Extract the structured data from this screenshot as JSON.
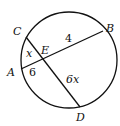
{
  "diagram": {
    "type": "intersecting-chords",
    "points": {
      "A": "A",
      "B": "B",
      "C": "C",
      "D": "D",
      "E": "E"
    },
    "chords": [
      {
        "name": "AB",
        "from": "A",
        "to": "B",
        "through": "E"
      },
      {
        "name": "CD",
        "from": "C",
        "to": "D",
        "through": "E"
      }
    ],
    "segment_labels": {
      "CE": "x",
      "EB": "4",
      "AE": "6",
      "ED": "6x"
    }
  }
}
